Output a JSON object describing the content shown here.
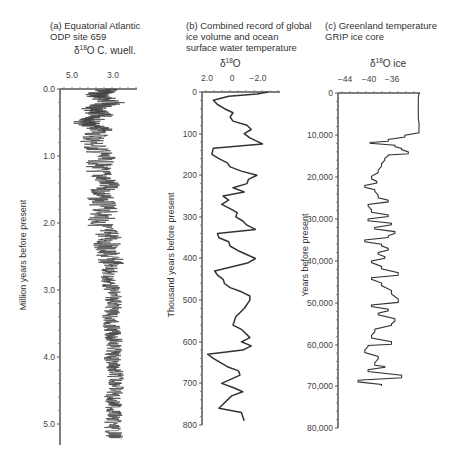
{
  "chart_data": [
    {
      "type": "line",
      "panel": "a",
      "title": "(a) Equatorial Atlantic\nODP site 659",
      "xlabel_prefix": "δ",
      "xlabel_sup": "18",
      "xlabel_suffix": "O C. wuell.",
      "ylabel": "Million years before present",
      "x_ticks": [
        "5.0",
        "3.0"
      ],
      "y_ticks": [
        "0.0",
        "1.0",
        "2.0",
        "3.0",
        "4.0",
        "5.0"
      ],
      "xlim": [
        5.5,
        2.4
      ],
      "ylim": [
        0,
        5.3
      ],
      "x_reversed": true,
      "y_inverted": true,
      "note": "High-frequency noisy record; amplitude ~1 permil, drifting from ~4.3 near base to ~3.9 at top",
      "series": [
        {
          "name": "δ18O C. wuell.",
          "age_ma": [
            0.0,
            0.1,
            0.2,
            0.3,
            0.4,
            0.5,
            0.6,
            0.8,
            1.0,
            1.2,
            1.4,
            1.6,
            1.8,
            2.0,
            2.2,
            2.4,
            2.6,
            2.8,
            3.0,
            3.2,
            3.4,
            3.6,
            3.8,
            4.0,
            4.2,
            4.4,
            4.6,
            4.8,
            5.0,
            5.2
          ],
          "values": [
            3.6,
            4.0,
            3.4,
            4.3,
            3.8,
            4.5,
            3.9,
            4.2,
            3.8,
            4.0,
            3.6,
            3.9,
            3.7,
            3.9,
            3.5,
            3.7,
            3.4,
            3.6,
            3.4,
            3.3,
            3.5,
            3.4,
            3.3,
            3.4,
            3.3,
            3.2,
            3.4,
            3.3,
            3.4,
            3.3
          ]
        }
      ]
    },
    {
      "type": "line",
      "panel": "b",
      "title": "(b) Combined record of global\nice volume and ocean\nsurface water temperature",
      "xlabel_prefix": "δ",
      "xlabel_sup": "18",
      "xlabel_suffix": "O",
      "ylabel": "Thousand years before present",
      "x_ticks": [
        "2.0",
        "0",
        "−2.0"
      ],
      "y_ticks": [
        "0",
        "100",
        "200",
        "300",
        "400",
        "500",
        "600",
        "700",
        "800"
      ],
      "xlim": [
        2.4,
        -3.0
      ],
      "ylim": [
        0,
        800
      ],
      "x_reversed": true,
      "y_inverted": true,
      "series": [
        {
          "name": "δ18O",
          "age_ka": [
            0,
            5,
            10,
            20,
            30,
            40,
            50,
            60,
            70,
            80,
            90,
            100,
            110,
            120,
            125,
            135,
            150,
            160,
            170,
            180,
            190,
            200,
            210,
            220,
            230,
            240,
            250,
            260,
            270,
            280,
            290,
            300,
            310,
            320,
            330,
            340,
            350,
            360,
            370,
            380,
            400,
            410,
            430,
            440,
            450,
            460,
            470,
            480,
            490,
            500,
            520,
            540,
            560,
            570,
            590,
            600,
            610,
            620,
            630,
            640,
            660,
            670,
            680,
            700,
            710,
            720,
            730,
            760,
            770,
            790
          ],
          "values": [
            -2.3,
            -1.5,
            0.5,
            1.6,
            1.3,
            0.8,
            0.2,
            0.4,
            0.2,
            -0.8,
            -1.1,
            -0.6,
            -1.0,
            -1.6,
            -1.9,
            1.6,
            1.7,
            1.2,
            0.6,
            0.4,
            -0.4,
            -1.5,
            -0.9,
            -0.8,
            0.2,
            -0.6,
            0.9,
            0.5,
            1.0,
            0.4,
            -0.1,
            0.0,
            -0.5,
            -0.8,
            -1.4,
            1.3,
            1.2,
            0.5,
            0.4,
            -0.1,
            -1.4,
            -0.9,
            1.5,
            1.3,
            0.9,
            0.8,
            0.4,
            -0.4,
            -1.0,
            -1.0,
            -0.6,
            0.0,
            0.2,
            -0.4,
            -1.0,
            -0.4,
            -1.1,
            -0.5,
            2.0,
            1.6,
            0.6,
            -0.2,
            -0.3,
            1.0,
            0.2,
            -0.5,
            0.3,
            1.2,
            -0.4,
            -0.6
          ]
        }
      ]
    },
    {
      "type": "line",
      "panel": "c",
      "title": "(c) Greenland temperature\nGRIP ice core",
      "xlabel_prefix": "δ",
      "xlabel_sup": "18",
      "xlabel_suffix": "O ice",
      "ylabel": "Years before present",
      "x_ticks": [
        "−44",
        "−40",
        "−36"
      ],
      "y_ticks": [
        "0",
        "10,000",
        "20,000",
        "30,000",
        "40,000",
        "50,000",
        "60,000",
        "70,000",
        "80,000"
      ],
      "xlim": [
        -47,
        -34
      ],
      "ylim": [
        0,
        80000
      ],
      "y_inverted": true,
      "series": [
        {
          "name": "δ18O ice",
          "years_bp": [
            0,
            2000,
            4000,
            6000,
            8000,
            9500,
            10500,
            11500,
            12000,
            12800,
            13500,
            14500,
            15000,
            16000,
            17500,
            19000,
            20500,
            21500,
            22500,
            23500,
            25000,
            26000,
            27000,
            28500,
            29500,
            30500,
            31500,
            32500,
            33500,
            34500,
            35500,
            36500,
            37500,
            38500,
            39500,
            40500,
            42000,
            43500,
            44500,
            46000,
            48000,
            50000,
            51000,
            52000,
            53000,
            54500,
            55500,
            57000,
            58500,
            60000,
            60500,
            62000,
            63500,
            65000,
            65500,
            66500,
            68000,
            69000,
            70000
          ],
          "values": [
            -34.9,
            -35.0,
            -35.0,
            -35.0,
            -34.9,
            -34.9,
            -37.0,
            -39.5,
            -42.2,
            -38.5,
            -37.5,
            -36.5,
            -39.5,
            -40.0,
            -40.5,
            -41.0,
            -42.0,
            -41.2,
            -43.0,
            -41.5,
            -41.0,
            -39.5,
            -42.5,
            -42.0,
            -39.5,
            -42.5,
            -39.0,
            -41.5,
            -38.5,
            -39.5,
            -43.0,
            -40.5,
            -39.5,
            -41.0,
            -40.0,
            -42.0,
            -40.5,
            -38.0,
            -42.0,
            -40.5,
            -39.0,
            -38.0,
            -42.0,
            -39.5,
            -41.0,
            -38.5,
            -39.0,
            -41.5,
            -42.0,
            -39.0,
            -42.5,
            -43.0,
            -41.0,
            -41.5,
            -40.0,
            -42.5,
            -37.5,
            -44.0,
            -40.5
          ]
        }
      ]
    }
  ]
}
